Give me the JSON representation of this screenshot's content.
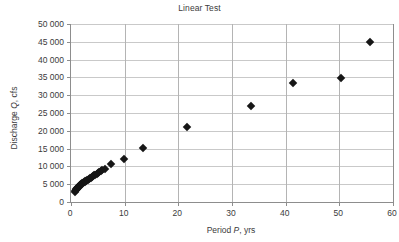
{
  "chart_data": {
    "type": "scatter",
    "title": "Linear Test",
    "xlabel_prefix": "Period ",
    "xlabel_var": "P",
    "xlabel_suffix": ", yrs",
    "ylabel_prefix": "Discharge ",
    "ylabel_var": "Q",
    "ylabel_suffix": ", cfs",
    "xlabel": "Period P, yrs",
    "ylabel": "Discharge Q, cfs",
    "xlim": [
      0,
      60
    ],
    "ylim": [
      0,
      50000
    ],
    "xticks": [
      0,
      10,
      20,
      30,
      40,
      50,
      60
    ],
    "xtick_labels": [
      "0",
      "10",
      "20",
      "30",
      "40",
      "50",
      "60"
    ],
    "yticks": [
      0,
      5000,
      10000,
      15000,
      20000,
      25000,
      30000,
      35000,
      40000,
      45000,
      50000
    ],
    "ytick_labels": [
      "0",
      "5 000",
      "10 000",
      "15 000",
      "20 000",
      "25 000",
      "30 000",
      "35 000",
      "40 000",
      "45 000",
      "50 000"
    ],
    "grid": {
      "horizontal": true,
      "vertical": true
    },
    "legend": null,
    "marker": {
      "shape": "diamond",
      "color": "#161616",
      "size_px": 6
    },
    "series": [
      {
        "name": "Annual peak discharge",
        "points": [
          [
            0.78,
            2700
          ],
          [
            0.83,
            3000
          ],
          [
            0.88,
            3250
          ],
          [
            0.95,
            3450
          ],
          [
            1.02,
            3600
          ],
          [
            1.1,
            3750
          ],
          [
            1.18,
            3900
          ],
          [
            1.26,
            4050
          ],
          [
            1.35,
            4200
          ],
          [
            1.44,
            4350
          ],
          [
            1.54,
            4500
          ],
          [
            1.64,
            4650
          ],
          [
            1.75,
            4800
          ],
          [
            1.86,
            4950
          ],
          [
            1.98,
            5100
          ],
          [
            2.11,
            5250
          ],
          [
            2.24,
            5400
          ],
          [
            2.38,
            5550
          ],
          [
            2.53,
            5700
          ],
          [
            2.68,
            5850
          ],
          [
            2.84,
            6000
          ],
          [
            3.0,
            6150
          ],
          [
            3.17,
            6300
          ],
          [
            3.35,
            6450
          ],
          [
            3.53,
            6650
          ],
          [
            3.72,
            6850
          ],
          [
            3.92,
            7050
          ],
          [
            4.12,
            7250
          ],
          [
            4.33,
            7450
          ],
          [
            4.55,
            7700
          ],
          [
            4.78,
            7950
          ],
          [
            5.02,
            8200
          ],
          [
            5.28,
            8500
          ],
          [
            5.55,
            8800
          ],
          [
            5.85,
            9050
          ],
          [
            6.3,
            9300
          ],
          [
            7.5,
            10800
          ],
          [
            9.8,
            12100
          ],
          [
            13.4,
            15300
          ],
          [
            21.7,
            21200
          ],
          [
            33.5,
            27000
          ],
          [
            41.4,
            33300
          ],
          [
            50.3,
            34900
          ],
          [
            55.7,
            44900
          ]
        ]
      }
    ]
  }
}
